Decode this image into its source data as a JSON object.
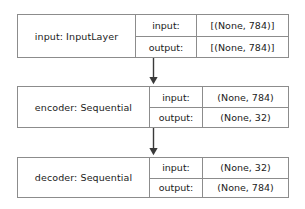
{
  "diagram": {
    "kind": "keras-plot-model",
    "orientation": "vertical-top-down",
    "background_color": "#ffffff",
    "border_color": "#8c8c8c",
    "text_color": "#1b1b1b",
    "edge_color": "#3a3a3a",
    "row_labels": {
      "input": "input:",
      "output": "output:"
    },
    "nodes": [
      {
        "id": "input",
        "name": "input: InputLayer",
        "layer_name": "input",
        "layer_type": "InputLayer",
        "input_label": "input:",
        "input_shape": "[(None, 784)]",
        "output_label": "output:",
        "output_shape": "[(None, 784)]"
      },
      {
        "id": "encoder",
        "name": "encoder: Sequential",
        "layer_name": "encoder",
        "layer_type": "Sequential",
        "input_label": "input:",
        "input_shape": "(None, 784)",
        "output_label": "output:",
        "output_shape": "(None, 32)"
      },
      {
        "id": "decoder",
        "name": "decoder: Sequential",
        "layer_name": "decoder",
        "layer_type": "Sequential",
        "input_label": "input:",
        "input_shape": "(None, 32)",
        "output_label": "output:",
        "output_shape": "(None, 784)"
      }
    ],
    "edges": [
      {
        "id": "edge-input-to-encoder",
        "from": "input",
        "to": "encoder",
        "arrowhead": "solid-triangle"
      },
      {
        "id": "edge-encoder-to-decoder",
        "from": "encoder",
        "to": "decoder",
        "arrowhead": "solid-triangle"
      }
    ]
  }
}
